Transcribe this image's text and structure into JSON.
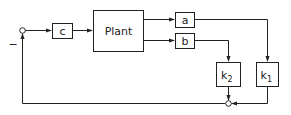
{
  "diagram": {
    "type": "block-diagram",
    "blocks": {
      "c": {
        "label": "c"
      },
      "plant": {
        "label": "Plant"
      },
      "a": {
        "label": "a"
      },
      "b": {
        "label": "b"
      },
      "k2": {
        "label": "k",
        "sub": "2"
      },
      "k1": {
        "label": "k",
        "sub": "1"
      }
    },
    "junctions": {
      "input_sum": {
        "sign": "−"
      },
      "feedback_sum": {}
    },
    "connections": [
      {
        "from": "input_sum",
        "to": "c"
      },
      {
        "from": "c",
        "to": "plant"
      },
      {
        "from": "plant",
        "to": "a"
      },
      {
        "from": "plant",
        "to": "b"
      },
      {
        "from": "a",
        "to": "k1"
      },
      {
        "from": "b",
        "to": "k2"
      },
      {
        "from": "k2",
        "to": "feedback_sum"
      },
      {
        "from": "k1",
        "to": "feedback_sum"
      },
      {
        "from": "feedback_sum",
        "to": "input_sum"
      }
    ],
    "colors": {
      "line": "#222222",
      "background": "#ffffff"
    }
  }
}
